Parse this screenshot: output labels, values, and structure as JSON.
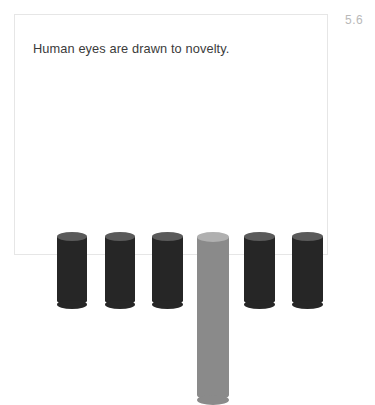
{
  "figure": {
    "number": "5.6",
    "title": "Human eyes are drawn to novelty."
  },
  "colors": {
    "background": "#ffffff",
    "card_border": "#e6e6e6",
    "title_text": "#3b3b3b",
    "figure_number_text": "#b9b9b9",
    "bar_default": "#262626",
    "bar_default_top": "#5a5a5a",
    "bar_highlight": "#8a8a8a",
    "bar_highlight_top": "#b0b0b0"
  },
  "chart_data": {
    "type": "bar",
    "title": "Human eyes are drawn to novelty.",
    "subtitle": "",
    "xlabel": "",
    "ylabel": "",
    "grid": false,
    "legend": "none",
    "ylim": [
      0,
      100
    ],
    "categories": [
      "1",
      "2",
      "3",
      "4",
      "5",
      "6"
    ],
    "values": [
      41,
      41,
      41,
      100,
      41,
      41
    ],
    "bars": [
      {
        "category": "1",
        "value": 41,
        "highlight": false,
        "color": "#262626",
        "top_color": "#5a5a5a",
        "left_px": 42,
        "width_px": 30,
        "height_px": 68
      },
      {
        "category": "2",
        "value": 41,
        "highlight": false,
        "color": "#262626",
        "top_color": "#5a5a5a",
        "left_px": 90,
        "width_px": 30,
        "height_px": 68
      },
      {
        "category": "3",
        "value": 41,
        "highlight": false,
        "color": "#262626",
        "top_color": "#5a5a5a",
        "left_px": 137,
        "width_px": 31,
        "height_px": 68
      },
      {
        "category": "4",
        "value": 100,
        "highlight": true,
        "color": "#8a8a8a",
        "top_color": "#b0b0b0",
        "left_px": 182,
        "width_px": 32,
        "height_px": 163
      },
      {
        "category": "5",
        "value": 41,
        "highlight": false,
        "color": "#262626",
        "top_color": "#5a5a5a",
        "left_px": 229,
        "width_px": 31,
        "height_px": 68
      },
      {
        "category": "6",
        "value": 41,
        "highlight": false,
        "color": "#262626",
        "top_color": "#5a5a5a",
        "left_px": 277,
        "width_px": 31,
        "height_px": 68
      }
    ],
    "baseline_px": 219,
    "annotations": []
  }
}
